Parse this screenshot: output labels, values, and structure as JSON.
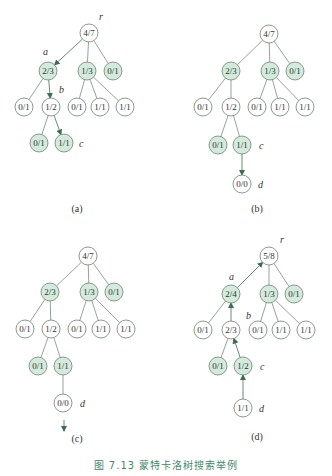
{
  "caption": "图 7.13   蒙特卡洛树搜索举例",
  "colors": {
    "fill_highlight": "#d3ebdc",
    "fill_plain": "#ffffff",
    "stroke": "#6f7f74",
    "edge": "#7d8a80",
    "arrow": "#3d6e52",
    "text": "#333333",
    "caption": "#3f8a66"
  },
  "panels": [
    {
      "label": "(a)",
      "label_pos": [
        77,
        212
      ],
      "nodes": [
        {
          "id": "r",
          "text": "4/7",
          "x": 89,
          "y": 33,
          "hl": false
        },
        {
          "id": "a",
          "text": "2/3",
          "x": 48,
          "y": 71,
          "hl": true
        },
        {
          "id": "m",
          "text": "1/3",
          "x": 87,
          "y": 71,
          "hl": true
        },
        {
          "id": "n",
          "text": "0/1",
          "x": 113,
          "y": 71,
          "hl": true
        },
        {
          "id": "a1",
          "text": "0/1",
          "x": 24,
          "y": 107,
          "hl": false
        },
        {
          "id": "b",
          "text": "1/2",
          "x": 51,
          "y": 107,
          "hl": false
        },
        {
          "id": "m1",
          "text": "0/1",
          "x": 77,
          "y": 107,
          "hl": false
        },
        {
          "id": "m2",
          "text": "1/1",
          "x": 100,
          "y": 107,
          "hl": false
        },
        {
          "id": "m3",
          "text": "1/1",
          "x": 125,
          "y": 107,
          "hl": false
        },
        {
          "id": "b1",
          "text": "0/1",
          "x": 39,
          "y": 143,
          "hl": true
        },
        {
          "id": "c",
          "text": "1/1",
          "x": 64,
          "y": 143,
          "hl": true
        }
      ],
      "edges": [
        {
          "from": "r",
          "to": "a",
          "arrow": "to"
        },
        {
          "from": "r",
          "to": "m"
        },
        {
          "from": "r",
          "to": "n"
        },
        {
          "from": "a",
          "to": "a1"
        },
        {
          "from": "a",
          "to": "b",
          "arrow": "to"
        },
        {
          "from": "m",
          "to": "m1"
        },
        {
          "from": "m",
          "to": "m2"
        },
        {
          "from": "m",
          "to": "m3"
        },
        {
          "from": "b",
          "to": "b1"
        },
        {
          "from": "b",
          "to": "c",
          "arrow": "to"
        }
      ],
      "tags": [
        {
          "text": "r",
          "x": 99,
          "y": 20
        },
        {
          "text": "a",
          "x": 43,
          "y": 55
        },
        {
          "text": "b",
          "x": 59,
          "y": 93
        },
        {
          "text": "c",
          "x": 79,
          "y": 147
        }
      ],
      "extra_arrows": []
    },
    {
      "label": "(b)",
      "label_pos": [
        257,
        212
      ],
      "nodes": [
        {
          "id": "r",
          "text": "4/7",
          "x": 269,
          "y": 34,
          "hl": false
        },
        {
          "id": "a",
          "text": "2/3",
          "x": 231,
          "y": 71,
          "hl": true
        },
        {
          "id": "m",
          "text": "1/3",
          "x": 270,
          "y": 71,
          "hl": true
        },
        {
          "id": "n",
          "text": "0/1",
          "x": 295,
          "y": 71,
          "hl": true
        },
        {
          "id": "a1",
          "text": "0/1",
          "x": 203,
          "y": 107,
          "hl": false
        },
        {
          "id": "b",
          "text": "1/2",
          "x": 231,
          "y": 107,
          "hl": false
        },
        {
          "id": "m1",
          "text": "0/1",
          "x": 257,
          "y": 107,
          "hl": false
        },
        {
          "id": "m2",
          "text": "1/1",
          "x": 280,
          "y": 107,
          "hl": false
        },
        {
          "id": "m3",
          "text": "1/1",
          "x": 305,
          "y": 107,
          "hl": false
        },
        {
          "id": "b1",
          "text": "0/1",
          "x": 218,
          "y": 145,
          "hl": true
        },
        {
          "id": "c",
          "text": "1/1",
          "x": 242,
          "y": 145,
          "hl": true
        },
        {
          "id": "d",
          "text": "0/0",
          "x": 242,
          "y": 184,
          "hl": false
        }
      ],
      "edges": [
        {
          "from": "r",
          "to": "a"
        },
        {
          "from": "r",
          "to": "m"
        },
        {
          "from": "r",
          "to": "n"
        },
        {
          "from": "a",
          "to": "a1"
        },
        {
          "from": "a",
          "to": "b"
        },
        {
          "from": "m",
          "to": "m1"
        },
        {
          "from": "m",
          "to": "m2"
        },
        {
          "from": "m",
          "to": "m3"
        },
        {
          "from": "b",
          "to": "b1"
        },
        {
          "from": "b",
          "to": "c"
        },
        {
          "from": "c",
          "to": "d",
          "arrow": "to"
        }
      ],
      "tags": [
        {
          "text": "c",
          "x": 259,
          "y": 149
        },
        {
          "text": "d",
          "x": 258,
          "y": 188
        }
      ],
      "extra_arrows": []
    },
    {
      "label": "(c)",
      "label_pos": [
        77,
        442
      ],
      "nodes": [
        {
          "id": "r",
          "text": "4/7",
          "x": 88,
          "y": 256,
          "hl": false
        },
        {
          "id": "a",
          "text": "2/3",
          "x": 50,
          "y": 292,
          "hl": true
        },
        {
          "id": "m",
          "text": "1/3",
          "x": 89,
          "y": 292,
          "hl": true
        },
        {
          "id": "n",
          "text": "0/1",
          "x": 114,
          "y": 292,
          "hl": true
        },
        {
          "id": "a1",
          "text": "0/1",
          "x": 25,
          "y": 329,
          "hl": false
        },
        {
          "id": "b",
          "text": "1/2",
          "x": 51,
          "y": 329,
          "hl": false
        },
        {
          "id": "m1",
          "text": "0/1",
          "x": 77,
          "y": 329,
          "hl": false
        },
        {
          "id": "m2",
          "text": "1/1",
          "x": 101,
          "y": 329,
          "hl": false
        },
        {
          "id": "m3",
          "text": "1/1",
          "x": 126,
          "y": 329,
          "hl": false
        },
        {
          "id": "b1",
          "text": "0/1",
          "x": 38,
          "y": 366,
          "hl": true
        },
        {
          "id": "c",
          "text": "1/1",
          "x": 63,
          "y": 366,
          "hl": true
        },
        {
          "id": "d",
          "text": "0/0",
          "x": 63,
          "y": 403,
          "hl": false
        }
      ],
      "edges": [
        {
          "from": "r",
          "to": "a"
        },
        {
          "from": "r",
          "to": "m"
        },
        {
          "from": "r",
          "to": "n"
        },
        {
          "from": "a",
          "to": "a1"
        },
        {
          "from": "a",
          "to": "b"
        },
        {
          "from": "m",
          "to": "m1"
        },
        {
          "from": "m",
          "to": "m2"
        },
        {
          "from": "m",
          "to": "m3"
        },
        {
          "from": "b",
          "to": "b1"
        },
        {
          "from": "b",
          "to": "c"
        },
        {
          "from": "c",
          "to": "d"
        }
      ],
      "tags": [
        {
          "text": "d",
          "x": 80,
          "y": 407
        }
      ],
      "extra_arrows": [
        {
          "x1": 64,
          "y1": 420,
          "x2": 64,
          "y2": 431
        }
      ]
    },
    {
      "label": "(d)",
      "label_pos": [
        257,
        440
      ],
      "nodes": [
        {
          "id": "r",
          "text": "5/8",
          "x": 269,
          "y": 256,
          "hl": false
        },
        {
          "id": "a",
          "text": "2/4",
          "x": 231,
          "y": 294,
          "hl": true
        },
        {
          "id": "m",
          "text": "1/3",
          "x": 269,
          "y": 294,
          "hl": true
        },
        {
          "id": "n",
          "text": "0/1",
          "x": 294,
          "y": 294,
          "hl": true
        },
        {
          "id": "a1",
          "text": "0/1",
          "x": 203,
          "y": 330,
          "hl": false
        },
        {
          "id": "b",
          "text": "2/3",
          "x": 231,
          "y": 330,
          "hl": false
        },
        {
          "id": "m1",
          "text": "0/1",
          "x": 258,
          "y": 330,
          "hl": false
        },
        {
          "id": "m2",
          "text": "1/1",
          "x": 281,
          "y": 330,
          "hl": false
        },
        {
          "id": "m3",
          "text": "1/1",
          "x": 306,
          "y": 330,
          "hl": false
        },
        {
          "id": "b1",
          "text": "0/1",
          "x": 218,
          "y": 366,
          "hl": true
        },
        {
          "id": "c",
          "text": "1/2",
          "x": 243,
          "y": 366,
          "hl": true
        },
        {
          "id": "d",
          "text": "1/1",
          "x": 243,
          "y": 408,
          "hl": false
        }
      ],
      "edges": [
        {
          "from": "a",
          "to": "r",
          "arrow": "to"
        },
        {
          "from": "r",
          "to": "m"
        },
        {
          "from": "r",
          "to": "n"
        },
        {
          "from": "a",
          "to": "a1"
        },
        {
          "from": "b",
          "to": "a",
          "arrow": "to"
        },
        {
          "from": "m",
          "to": "m1"
        },
        {
          "from": "m",
          "to": "m2"
        },
        {
          "from": "m",
          "to": "m3"
        },
        {
          "from": "b",
          "to": "b1"
        },
        {
          "from": "c",
          "to": "b",
          "arrow": "to"
        },
        {
          "from": "d",
          "to": "c",
          "arrow": "to"
        }
      ],
      "tags": [
        {
          "text": "r",
          "x": 280,
          "y": 243
        },
        {
          "text": "a",
          "x": 229,
          "y": 280
        },
        {
          "text": "b",
          "x": 246,
          "y": 319
        },
        {
          "text": "c",
          "x": 260,
          "y": 370
        },
        {
          "text": "d",
          "x": 259,
          "y": 412
        }
      ],
      "extra_arrows": []
    }
  ]
}
